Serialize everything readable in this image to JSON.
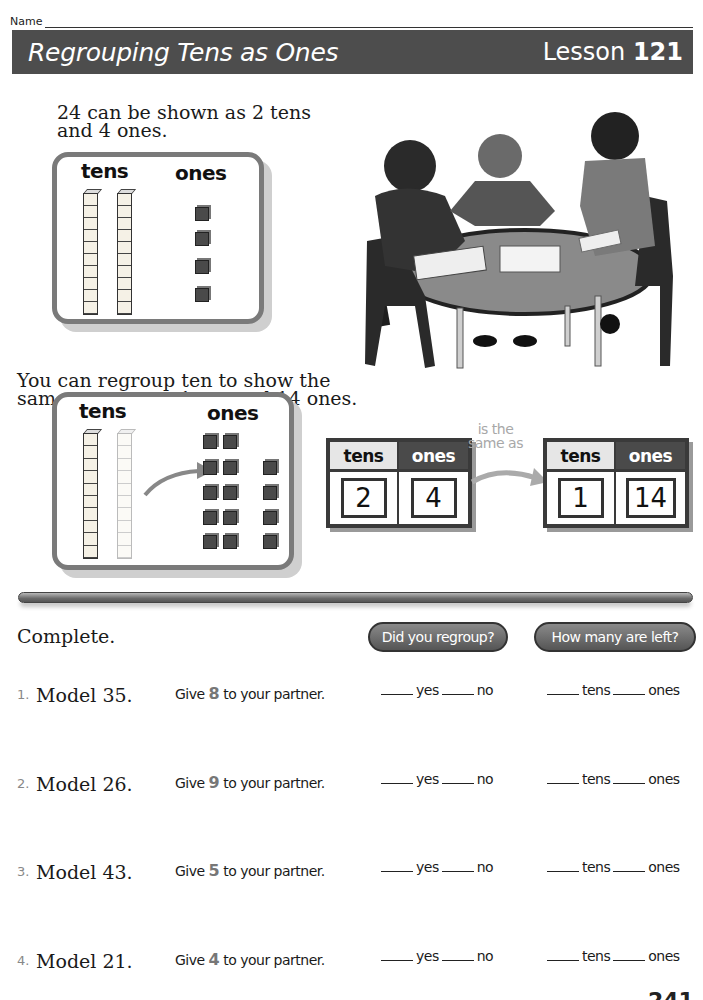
{
  "header": {
    "name_label": "Name",
    "title": "Regrouping Tens as Ones",
    "lesson_prefix": "Lesson",
    "lesson_number": "121"
  },
  "intro": {
    "text1": "24 can be shown as 2 tens and 4 ones.",
    "text2": "You can regroup ten to show the same amount as 1 ten and 14 ones."
  },
  "model1": {
    "tens_label": "tens",
    "ones_label": "ones",
    "tens_rods": 2,
    "ones_cubes": 4
  },
  "model2": {
    "tens_label": "tens",
    "ones_label": "ones",
    "tens_rods": 1,
    "faded_rods": 1,
    "ones_cubes": 14
  },
  "place_value": {
    "left": {
      "tens_label": "tens",
      "ones_label": "ones",
      "tens": "2",
      "ones": "4"
    },
    "connector_line1": "is the",
    "connector_line2": "same as",
    "right": {
      "tens_label": "tens",
      "ones_label": "ones",
      "tens": "1",
      "ones": "14"
    }
  },
  "photo": {
    "alt": "Three children working with base-ten blocks at a round table"
  },
  "practice": {
    "heading": "Complete.",
    "pill1": "Did you regroup?",
    "pill2": "How many are left?",
    "yes_label": "yes",
    "no_label": "no",
    "tens_label": "tens",
    "ones_label": "ones",
    "give_prefix": "Give",
    "give_suffix": "to your partner.",
    "exercises": [
      {
        "num": "1.",
        "model": "Model 35.",
        "give": "8"
      },
      {
        "num": "2.",
        "model": "Model 26.",
        "give": "9"
      },
      {
        "num": "3.",
        "model": "Model 43.",
        "give": "5"
      },
      {
        "num": "4.",
        "model": "Model 21.",
        "give": "4"
      }
    ]
  },
  "footer": {
    "page_number": "241"
  }
}
